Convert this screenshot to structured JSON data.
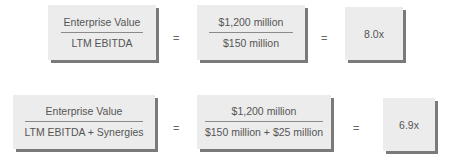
{
  "row1": {
    "formula": {
      "numerator": "Enterprise Value",
      "denominator": "LTM EBITDA"
    },
    "equals_1": "=",
    "values": {
      "numerator": "$1,200 million",
      "denominator": "$150 million"
    },
    "equals_2": "=",
    "result": "8.0x"
  },
  "row2": {
    "formula": {
      "numerator": "Enterprise Value",
      "denominator": "LTM EBITDA + Synergies"
    },
    "equals_1": "=",
    "values": {
      "numerator": "$1,200 million",
      "denominator": "$150 million + $25 million"
    },
    "equals_2": "=",
    "result": "6.9x"
  },
  "colors": {
    "box_fill": "#ececec",
    "box_shadow": "#7a7a7a",
    "text": "#555555",
    "background": "#ffffff"
  }
}
